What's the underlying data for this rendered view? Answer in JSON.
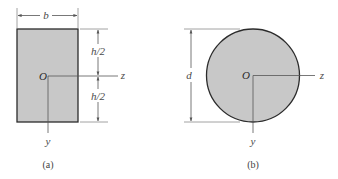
{
  "figure_a": {
    "caption": "(a)",
    "shape": "rectangle",
    "width_label": "b",
    "upper_half_label": "h/2",
    "lower_half_label": "h/2",
    "origin_label": "O",
    "z_axis_label": "z",
    "y_axis_label": "y"
  },
  "figure_b": {
    "caption": "(b)",
    "shape": "circle",
    "diameter_label": "d",
    "origin_label": "O",
    "z_axis_label": "z",
    "y_axis_label": "y"
  },
  "colors": {
    "fill": "#c8c8c8",
    "outline": "#2b2b2b",
    "dimension_lines": "#8a8a8a",
    "axes": "#555555",
    "text": "#4a4a4a"
  }
}
